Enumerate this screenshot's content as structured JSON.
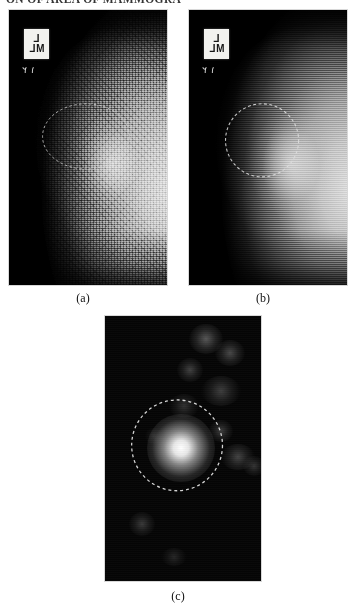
{
  "page": {
    "running_head": "ON OF AREA OF MAMMOGRA",
    "background_color": "#ffffff",
    "width": 357,
    "height": 611
  },
  "figure": {
    "panels": [
      {
        "id": "a",
        "caption": "(a)",
        "kind": "mammogram-original",
        "marker": {
          "line1": "L",
          "line2": "ML",
          "digits": "٢ ١"
        },
        "annotation": {
          "shape": "dashed-ellipse",
          "color": "#cfcfcf",
          "label": "suspicious-lesion-region"
        }
      },
      {
        "id": "b",
        "caption": "(b)",
        "kind": "mammogram-enhanced",
        "marker": {
          "line1": "L",
          "line2": "ML",
          "digits": "٢ ١"
        },
        "annotation": {
          "shape": "dashed-circle",
          "color": "#d9d9d9",
          "label": "suspicious-lesion-region"
        }
      },
      {
        "id": "c",
        "caption": "(c)",
        "kind": "segmentation-result",
        "annotation": {
          "shape": "dashed-circle",
          "color": "#e6e6e6",
          "label": "detected-mass"
        }
      }
    ]
  },
  "colors": {
    "film_black": "#000000",
    "marker_plate": "#f2f2ef",
    "annotation_stroke": "#d5d5d5",
    "caption_text": "#111111"
  }
}
